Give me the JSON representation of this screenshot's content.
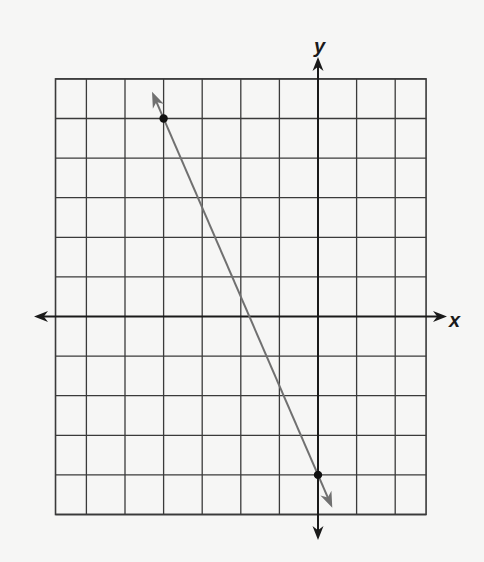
{
  "figure": {
    "x_axis_label": "x",
    "y_axis_label": "y",
    "colors": {
      "background": "#f6f6f5",
      "grid": "#3a3a3a",
      "axes": "#1a1a1a",
      "line": "#707070",
      "points": "#111111"
    }
  },
  "chart_data": {
    "type": "line",
    "title": "",
    "xlabel": "x",
    "ylabel": "y",
    "grid": true,
    "xlim": [
      -6.8,
      2.8
    ],
    "ylim": [
      -5,
      6
    ],
    "grid_step": 1,
    "axis_arrows": true,
    "points": [
      {
        "x": -4,
        "y": 5
      },
      {
        "x": 0,
        "y": -4
      }
    ],
    "series": [
      {
        "name": "line",
        "x": [
          -4,
          0
        ],
        "y": [
          5,
          -4
        ],
        "slope": -2.25,
        "y_intercept": -4,
        "arrows_both_ends": true
      }
    ]
  }
}
